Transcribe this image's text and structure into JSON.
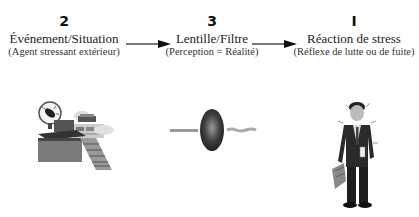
{
  "stages": [
    {
      "number": "2",
      "title": "Événement/Situation",
      "subtitle": "(Agent stressant extérieur)",
      "illustration": "office-desk-clock-papers"
    },
    {
      "number": "3",
      "title": "Lentille/Filtre",
      "subtitle": "(Perception = Réalité)",
      "illustration": "lens-with-light-rays"
    },
    {
      "number": "I",
      "title": "Réaction de stress",
      "subtitle": "(Réflexe de lutte ou de fuite)",
      "illustration": "stressed-businessman-with-briefcase"
    }
  ],
  "arrows": [
    {
      "from": "Événement/Situation",
      "to": "Lentille/Filtre"
    },
    {
      "from": "Lentille/Filtre",
      "to": "Réaction de stress"
    }
  ],
  "colors": {
    "arrow_shaft": "#777777",
    "arrow_head": "#111111",
    "lens": "#3a3a3a"
  }
}
